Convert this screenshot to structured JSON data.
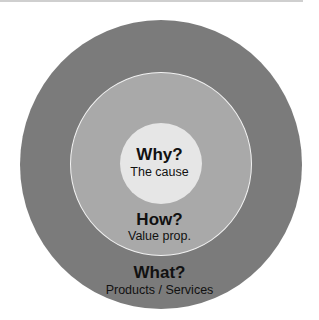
{
  "diagram": {
    "type": "golden-circle",
    "rings": [
      {
        "id": "inner",
        "title": "Why?",
        "subtitle": "The cause",
        "color": "#e6e6e6"
      },
      {
        "id": "middle",
        "title": "How?",
        "subtitle": "Value prop.",
        "color": "#a9a9a9"
      },
      {
        "id": "outer",
        "title": "What?",
        "subtitle": "Products / Services",
        "color": "#7b7b7b"
      }
    ]
  }
}
